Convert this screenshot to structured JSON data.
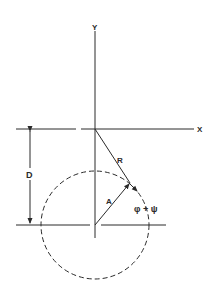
{
  "figure": {
    "labels": {
      "y_axis": "Y",
      "x_axis": "X",
      "distance": "D",
      "vector_a": "A",
      "vector_r": "R",
      "angle": "φ + ψ"
    },
    "colors": {
      "stroke": "#2a2a2a",
      "background": "#ffffff"
    }
  }
}
